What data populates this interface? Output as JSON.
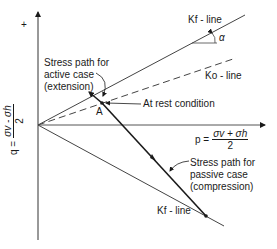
{
  "diagram": {
    "axes": {
      "y_axis_sign": "+",
      "q_label": {
        "lhs": "q =",
        "numerator": "σv - σh",
        "denominator": "2"
      },
      "p_label": {
        "lhs": "p =",
        "numerator": "σv + σh",
        "denominator": "2"
      }
    },
    "lines": {
      "kf_upper": "Kf - line",
      "ko": "Ko - line",
      "kf_lower": "Kf - line",
      "angle": "α"
    },
    "points": {
      "a": "A"
    },
    "annotations": {
      "active_line1": "Stress path for",
      "active_line2": "active case",
      "active_line3": "(extension)",
      "at_rest": "At rest condition",
      "passive_line1": "Stress path for",
      "passive_line2": "passive case",
      "passive_line3": "(compression)"
    },
    "colors": {
      "line": "#1a1a1a",
      "grey_line": "#555555"
    }
  }
}
